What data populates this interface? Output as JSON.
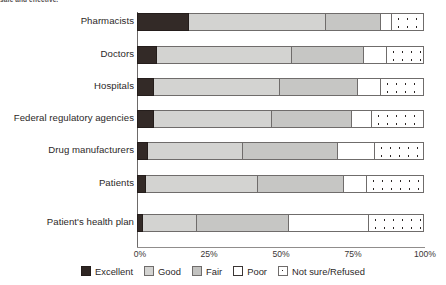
{
  "caption": {
    "clipped_text": "safe and effective."
  },
  "chart_data": {
    "type": "bar",
    "orientation": "horizontal",
    "stacked": true,
    "stack_unit": "percent",
    "title": "",
    "subtitle": "",
    "xlabel": "",
    "ylabel": "",
    "xlim": [
      0,
      100
    ],
    "xticks": [
      0,
      25,
      50,
      75,
      100
    ],
    "xtick_labels": [
      "0%",
      "25%",
      "50%",
      "75%",
      "100%"
    ],
    "grid": false,
    "legend_position": "bottom",
    "categories": [
      "Pharmacists",
      "Doctors",
      "Hospitals",
      "Federal regulatory agencies",
      "Drug manufacturers",
      "Patients",
      "Patient's health plan"
    ],
    "series": [
      {
        "name": "Excellent",
        "color": "#2e2623",
        "values": [
          18,
          7,
          6,
          6,
          4,
          3,
          2
        ]
      },
      {
        "name": "Good",
        "color": "#d3d3d1",
        "values": [
          48,
          47,
          44,
          41,
          33,
          39,
          19
        ]
      },
      {
        "name": "Fair",
        "color": "#c2c2c0",
        "values": [
          19,
          25,
          27,
          28,
          33,
          30,
          32
        ]
      },
      {
        "name": "Poor",
        "color": "#ffffff",
        "values": [
          4,
          8,
          8,
          7,
          13,
          8,
          28
        ]
      },
      {
        "name": "Not sure/Refused",
        "color": "#ffffff",
        "pattern": "dots",
        "values": [
          11,
          13,
          15,
          18,
          17,
          20,
          19
        ]
      }
    ],
    "legend_entries": [
      "Excellent",
      "Good",
      "Fair",
      "Poor",
      "Not sure/Refused"
    ]
  },
  "colors": {
    "excellent": "#2e2623",
    "good": "#d3d3d1",
    "fair": "#c2c2c0",
    "poor": "#ffffff",
    "not_sure": "#ffffff",
    "axis": "#6d6a69",
    "text": "#2c2828",
    "background": "#ffffff"
  }
}
